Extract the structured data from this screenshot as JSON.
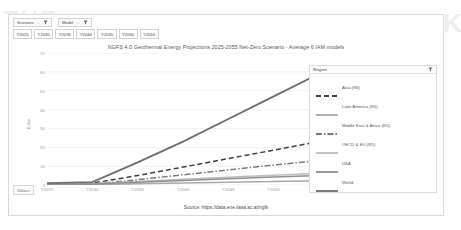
{
  "background_text": {
    "right": "THE HOW SUCKS",
    "left": "THE"
  },
  "slicers": [
    {
      "label": "Scenario",
      "icon": "filter-icon"
    },
    {
      "label": "Model",
      "icon": "filter-icon"
    }
  ],
  "year_buttons": [
    "Y2025",
    "Y2030",
    "Y2035",
    "Y2040",
    "Y2045",
    "Y2050",
    "Y2055"
  ],
  "values_button": {
    "label": "Values"
  },
  "legend": {
    "title": "Region",
    "filter_icon": "filter-icon"
  },
  "source": {
    "text": "Source: https://data.ene.iiasa.ac.at/ngfs"
  },
  "colors": {
    "asia": "#3f3f3f",
    "latin_america": "#a9a9a9",
    "middle_east_africa": "#7a7a7a",
    "oecd_eu": "#bdbdbd",
    "usa": "#8f8f8f",
    "world": "#6e6e6e",
    "grid": "#ededed",
    "axis_text": "#9a9a9a",
    "panel_border": "#dcdcdc"
  },
  "chart_data": {
    "type": "line",
    "title": "NGFS 4.0 Geothermal Energy Projections 2025-2055 Net-Zero Scenario - Average 6 IAM models",
    "xlabel": "",
    "ylabel": "EJ/yr",
    "categories": [
      "Y2025",
      "Y2030",
      "Y2035",
      "Y2040",
      "Y2045",
      "Y2050",
      "Y2055"
    ],
    "ylim": [
      0,
      70
    ],
    "yticks": [
      0,
      10,
      20,
      30,
      40,
      50,
      60,
      70
    ],
    "grid": true,
    "legend_position": "right",
    "series": [
      {
        "name": "Asia (R6)",
        "values": [
          0.4,
          1.0,
          5.0,
          9.5,
          14.0,
          18.5,
          23.0
        ],
        "style": "dashed",
        "color": "#3f3f3f"
      },
      {
        "name": "Latin America (R6)",
        "values": [
          0.1,
          0.2,
          0.6,
          1.0,
          1.4,
          1.8,
          2.2
        ],
        "style": "solid",
        "color": "#a9a9a9"
      },
      {
        "name": "Middle East & Africa (R5)",
        "values": [
          0.2,
          0.5,
          2.8,
          5.4,
          8.0,
          10.6,
          13.0
        ],
        "style": "dashdot",
        "color": "#7a7a7a"
      },
      {
        "name": "OECD & EU (R5)",
        "values": [
          0.3,
          0.7,
          1.8,
          3.0,
          4.1,
          5.2,
          6.2
        ],
        "style": "solid",
        "color": "#bdbdbd"
      },
      {
        "name": "USA",
        "values": [
          0.2,
          0.5,
          1.4,
          2.4,
          3.3,
          4.2,
          5.0
        ],
        "style": "solid",
        "color": "#8f8f8f"
      },
      {
        "name": "World",
        "values": [
          1.0,
          1.5,
          12.0,
          23.0,
          35.0,
          47.0,
          59.0
        ],
        "style": "solid",
        "color": "#6e6e6e"
      }
    ]
  }
}
